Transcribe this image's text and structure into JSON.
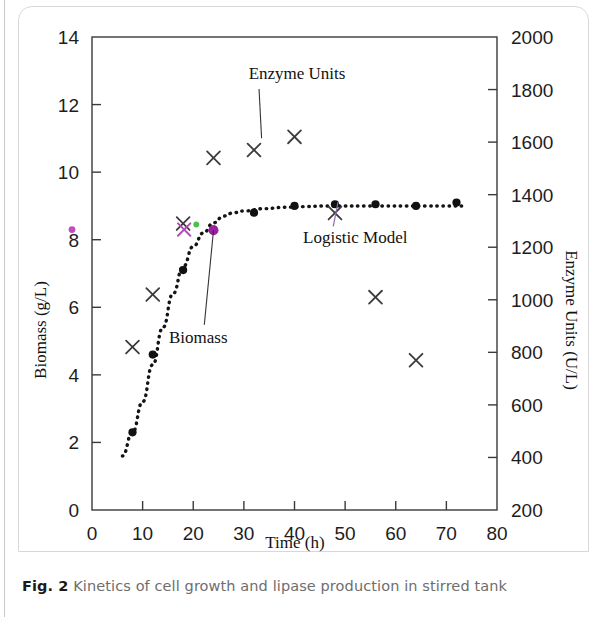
{
  "caption": {
    "figure_number": "Fig. 2",
    "text": "Kinetics of cell growth and lipase production in stirred tank"
  },
  "chart_data": {
    "type": "scatter",
    "title": "",
    "xlabel": "Time (h)",
    "ylabel": "Biomass (g/L)",
    "y2label": "Enzyme Units (U/L)",
    "xlim": [
      0,
      80
    ],
    "ylim": [
      0,
      14
    ],
    "y2lim": [
      200,
      2000
    ],
    "xticks": [
      0,
      10,
      20,
      30,
      40,
      50,
      60,
      70,
      80
    ],
    "yticks": [
      0,
      2,
      4,
      6,
      8,
      10,
      12,
      14
    ],
    "y2ticks": [
      200,
      400,
      600,
      800,
      1000,
      1200,
      1400,
      1600,
      1800,
      2000
    ],
    "grid": false,
    "legend_position": "inline-annotations",
    "series": [
      {
        "name": "Biomass",
        "marker": "filled-circle",
        "color": "#111111",
        "axis": "left",
        "x": [
          8,
          12,
          18,
          24,
          32,
          40,
          48,
          56,
          64,
          72
        ],
        "values": [
          2.3,
          4.6,
          7.1,
          8.3,
          8.8,
          9.0,
          9.05,
          9.05,
          9.0,
          9.1
        ]
      },
      {
        "name": "Enzyme Units",
        "marker": "cross",
        "color": "#3b3b3b",
        "axis": "right",
        "x": [
          8,
          12,
          18,
          24,
          32,
          40,
          48,
          56,
          64
        ],
        "values": [
          820,
          1020,
          1290,
          1540,
          1570,
          1620,
          1330,
          1010,
          770
        ]
      },
      {
        "name": "Logistic Model",
        "marker": "dotted-line",
        "color": "#141414",
        "axis": "left",
        "x": [
          6,
          8,
          10,
          12,
          14,
          16,
          18,
          20,
          22,
          24,
          26,
          28,
          30,
          34,
          38,
          42,
          46,
          50,
          54,
          58,
          62,
          66,
          70,
          74
        ],
        "values": [
          1.6,
          2.3,
          3.2,
          4.3,
          5.4,
          6.4,
          7.2,
          7.8,
          8.2,
          8.5,
          8.7,
          8.8,
          8.85,
          8.92,
          8.96,
          8.98,
          9.0,
          9.0,
          9.0,
          9.0,
          9.0,
          9.0,
          9.0,
          9.0
        ]
      }
    ],
    "annotations": [
      {
        "label": "Enzyme Units",
        "text_x": 40.5,
        "text_y": 1840,
        "point_x": 33.5,
        "point_y": 1615
      },
      {
        "label": "Biomass",
        "text_x": 21.0,
        "text_y": 4.95,
        "point_x": 24.0,
        "point_y": 8.28
      },
      {
        "label": "Logistic Model",
        "text_x": 52.0,
        "text_y": 1215,
        "point_x": 48.6,
        "point_y": 1372
      }
    ],
    "color_key_marks": [
      {
        "name": "enzyme-sample-cross",
        "color": "#b14fb1",
        "x": 18.2,
        "y": 8.3
      },
      {
        "name": "model-sample-dot",
        "color": "#49c24a",
        "x": 20.6,
        "y": 8.45
      },
      {
        "name": "biomass-sample-dot",
        "color": "#9b1fa0",
        "x": 24.0,
        "y": 8.28
      },
      {
        "name": "axis-highlight-dot",
        "color": "#c24bbd",
        "x": -2.6,
        "y": 8.3
      }
    ]
  }
}
